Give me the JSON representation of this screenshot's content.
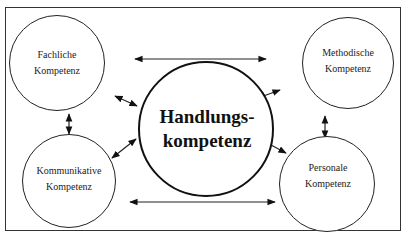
{
  "diagram": {
    "center": {
      "line1": "Handlungs-",
      "line2": "kompetenz"
    },
    "nodes": [
      {
        "id": "fachliche",
        "line1": "Fachliche",
        "line2": "Kompetenz",
        "position": "top-left"
      },
      {
        "id": "methodische",
        "line1": "Methodische",
        "line2": "Kompetenz",
        "position": "top-right"
      },
      {
        "id": "kommunikative",
        "line1": "Kommunikative",
        "line2": "Kompetenz",
        "position": "bottom-left"
      },
      {
        "id": "personale",
        "line1": "Personale",
        "line2": "Kompetenz",
        "position": "bottom-right"
      }
    ],
    "connections": [
      {
        "from": "fachliche",
        "to": "methodische",
        "type": "bidirectional"
      },
      {
        "from": "kommunikative",
        "to": "personale",
        "type": "bidirectional"
      },
      {
        "from": "fachliche",
        "to": "kommunikative",
        "type": "bidirectional"
      },
      {
        "from": "methodische",
        "to": "personale",
        "type": "bidirectional"
      },
      {
        "from": "fachliche",
        "to": "handlungskompetenz",
        "type": "bidirectional"
      },
      {
        "from": "methodische",
        "to": "handlungskompetenz",
        "type": "bidirectional"
      },
      {
        "from": "kommunikative",
        "to": "handlungskompetenz",
        "type": "bidirectional"
      },
      {
        "from": "personale",
        "to": "handlungskompetenz",
        "type": "bidirectional"
      }
    ],
    "colors": {
      "stroke": "#1a1a1a",
      "background": "#ffffff"
    }
  }
}
